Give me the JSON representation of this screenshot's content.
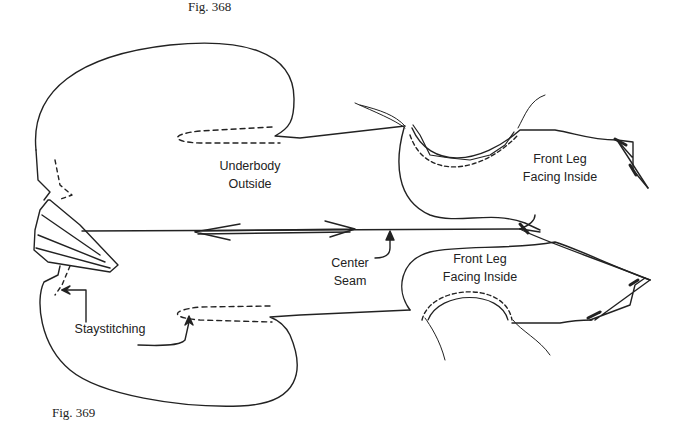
{
  "figures": {
    "top_caption": "Fig. 368",
    "bottom_caption": "Fig. 369"
  },
  "labels": {
    "underbody": [
      "Underbody",
      "Outside"
    ],
    "front_leg_top": [
      "Front Leg",
      "Facing Inside"
    ],
    "front_leg_bottom": [
      "Front Leg",
      "Facing Inside"
    ],
    "center_seam": [
      "Center",
      "Seam"
    ],
    "staystitching": "Staystitching"
  },
  "colors": {
    "line": "#222222",
    "background": "#ffffff"
  }
}
